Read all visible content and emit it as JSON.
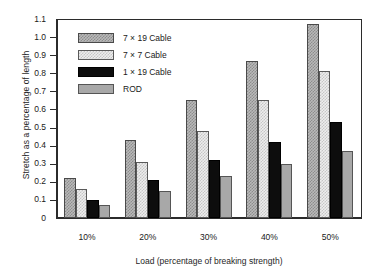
{
  "chart_data": {
    "type": "bar",
    "title": "",
    "xlabel": "Load (percentage of breaking strength)",
    "ylabel": "Stretch as a percentage of length",
    "categories": [
      "10%",
      "20%",
      "30%",
      "40%",
      "50%"
    ],
    "ylim": [
      0,
      1.1
    ],
    "ytick_labels": [
      "1.1",
      "1.0",
      "0.9",
      "0.8",
      "0.7",
      "0.6",
      "0.5",
      "0.4",
      "0.3",
      "0.2",
      "0.1",
      "0"
    ],
    "ytick_values": [
      1.1,
      1.0,
      0.9,
      0.8,
      0.7,
      0.6,
      0.5,
      0.4,
      0.3,
      0.2,
      0.1,
      0
    ],
    "grid": false,
    "legend_position": "upper-left-inside",
    "series": [
      {
        "name": "7 × 19  Cable",
        "swatch": "medium-gray-checker",
        "values": [
          0.22,
          0.43,
          0.65,
          0.87,
          1.07
        ]
      },
      {
        "name": "7 × 7    Cable",
        "swatch": "light-gray-checker",
        "values": [
          0.16,
          0.31,
          0.48,
          0.65,
          0.81
        ]
      },
      {
        "name": "1 × 19  Cable",
        "swatch": "solid-black",
        "values": [
          0.1,
          0.21,
          0.32,
          0.42,
          0.53
        ]
      },
      {
        "name": "ROD",
        "swatch": "solid-gray",
        "values": [
          0.07,
          0.15,
          0.23,
          0.3,
          0.37
        ]
      }
    ]
  },
  "colors": {
    "axis": "#2b2b2b",
    "series_0": "#b9b9b9",
    "series_1": "#ededed",
    "series_2": "#0d0d0d",
    "series_3": "#a8a8a8",
    "background": "#ffffff"
  }
}
